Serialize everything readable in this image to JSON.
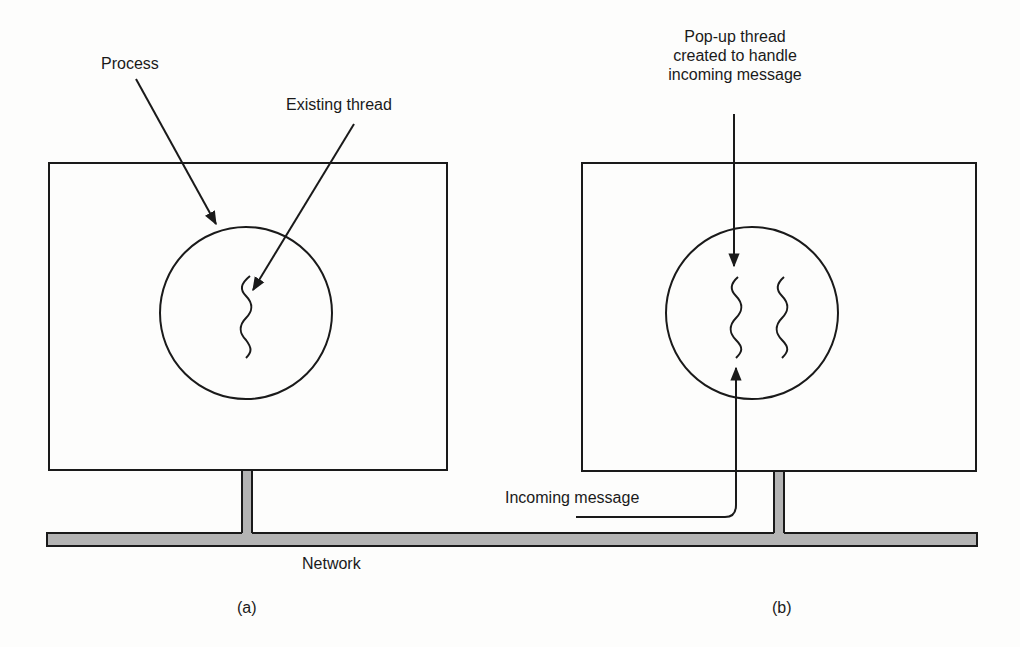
{
  "diagram": {
    "panels": [
      {
        "id": "a",
        "caption": "(a)",
        "labels": {
          "process": "Process",
          "existing_thread": "Existing thread"
        },
        "thread_count": 1
      },
      {
        "id": "b",
        "caption": "(b)",
        "labels": {
          "popup_thread_line1": "Pop-up thread",
          "popup_thread_line2": "created to handle",
          "popup_thread_line3": "incoming message",
          "incoming_message": "Incoming message"
        },
        "thread_count": 2
      }
    ],
    "network_label": "Network",
    "colors": {
      "stroke": "#1a1a1a",
      "network_fill": "#b4b4b4",
      "background": "#fdfdfc"
    }
  }
}
